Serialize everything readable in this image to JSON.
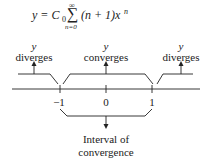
{
  "formula": {
    "lhs": "y = C",
    "sub0": "0",
    "sigma": "∑",
    "upper": "∞",
    "lower": "n=0",
    "rhs": "(n + 1)x",
    "exp": "n"
  },
  "regions": [
    {
      "var": "y",
      "label": "diverges"
    },
    {
      "var": "y",
      "label": "converges"
    },
    {
      "var": "y",
      "label": "diverges"
    }
  ],
  "ticks": [
    "−1",
    "0",
    "1"
  ],
  "interval": {
    "line1": "Interval of",
    "line2": "convergence"
  }
}
